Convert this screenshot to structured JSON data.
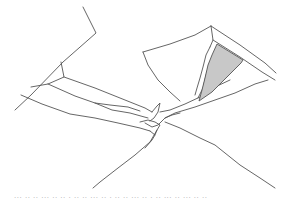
{
  "figure": {
    "colors": {
      "line": "#555555",
      "shade": "#c8c8c8",
      "background": "#ffffff"
    }
  },
  "caption": {
    "text": "··· ·· ·· ··· ·· ·· · ·· ·· ··· ·· · ·· ·· ··· ·· · ·· ··· ·· ··· ·· ··",
    "legible": false,
    "color": "#b0b0b0"
  }
}
